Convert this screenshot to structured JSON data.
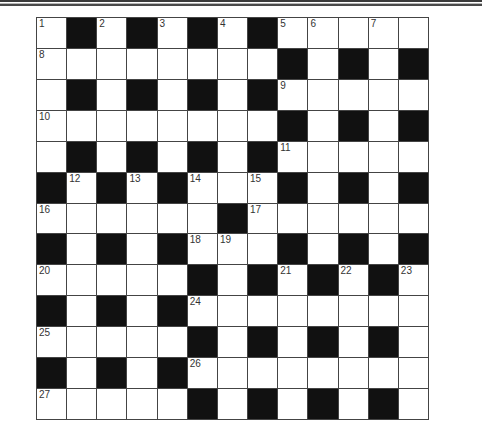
{
  "puzzle": {
    "rows": 13,
    "cols": 13,
    "colors": {
      "black_cell": "#111111",
      "white_cell": "#ffffff",
      "grid_line": "#444444",
      "number_text": "#333333"
    },
    "grid": [
      [
        "1",
        "#",
        "2",
        "#",
        "3",
        "#",
        "4",
        "#",
        "5",
        "6",
        "",
        "7",
        ""
      ],
      [
        "8",
        "",
        "",
        "",
        "",
        "",
        "",
        "",
        "#",
        "",
        "#",
        "",
        "#"
      ],
      [
        "",
        "#",
        "",
        "#",
        "",
        "#",
        "",
        "#",
        "9",
        "",
        "",
        "",
        ""
      ],
      [
        "10",
        "",
        "",
        "",
        "",
        "",
        "",
        "",
        "#",
        "",
        "#",
        "",
        "#"
      ],
      [
        "",
        "#",
        "",
        "#",
        "",
        "#",
        "",
        "#",
        "11",
        "",
        "",
        "",
        ""
      ],
      [
        "#",
        "12",
        "#",
        "13",
        "#",
        "14",
        "",
        "15",
        "#",
        "",
        "#",
        "",
        "#"
      ],
      [
        "16",
        "",
        "",
        "",
        "",
        "",
        "#",
        "17",
        "",
        "",
        "",
        "",
        ""
      ],
      [
        "#",
        "",
        "#",
        "",
        "#",
        "18",
        "19",
        "",
        "#",
        "",
        "#",
        "",
        "#"
      ],
      [
        "20",
        "",
        "",
        "",
        "",
        "#",
        "",
        "#",
        "21",
        "#",
        "22",
        "#",
        "23"
      ],
      [
        "#",
        "",
        "#",
        "",
        "#",
        "24",
        "",
        "",
        "",
        "",
        "",
        "",
        ""
      ],
      [
        "25",
        "",
        "",
        "",
        "",
        "#",
        "",
        "#",
        "",
        "#",
        "",
        "#",
        ""
      ],
      [
        "#",
        "",
        "#",
        "",
        "#",
        "26",
        "",
        "",
        "",
        "",
        "",
        "",
        ""
      ],
      [
        "27",
        "",
        "",
        "",
        "",
        "#",
        "",
        "#",
        "",
        "#",
        "",
        "#",
        ""
      ]
    ],
    "clue_numbers": [
      "1",
      "2",
      "3",
      "4",
      "5",
      "6",
      "7",
      "8",
      "9",
      "10",
      "11",
      "12",
      "13",
      "14",
      "15",
      "16",
      "17",
      "18",
      "19",
      "20",
      "21",
      "22",
      "23",
      "24",
      "25",
      "26",
      "27"
    ]
  }
}
